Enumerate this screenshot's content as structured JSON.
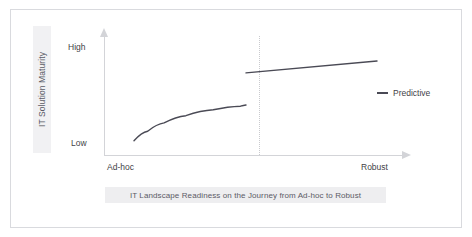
{
  "chart_data": {
    "type": "line",
    "title": "IT Landscape Readiness on the Journey from Ad-hoc to Robust",
    "xlabel": "",
    "ylabel": "IT Solution Maturity",
    "x_tick_labels": [
      "Ad-hoc",
      "Robust"
    ],
    "y_tick_labels": [
      "Low",
      "High"
    ],
    "ylim": [
      "Low",
      "High"
    ],
    "grid": false,
    "legend_position": "right",
    "legend": [
      "Predictive"
    ],
    "annotations": [
      "phase divider between Ad-hoc segment and Predictive segment"
    ],
    "series": [
      {
        "name": "Ad-hoc maturity curve",
        "shape": "concave-logarithmic",
        "points": [
          {
            "x": 0.11,
            "y": 0.12
          },
          {
            "x": 0.16,
            "y": 0.2
          },
          {
            "x": 0.22,
            "y": 0.27
          },
          {
            "x": 0.3,
            "y": 0.33
          },
          {
            "x": 0.4,
            "y": 0.38
          },
          {
            "x": 0.5,
            "y": 0.41
          },
          {
            "x": 0.52,
            "y": 0.42
          }
        ]
      },
      {
        "name": "Predictive",
        "shape": "linear-rising",
        "points": [
          {
            "x": 0.52,
            "y": 0.69
          },
          {
            "x": 1.0,
            "y": 0.79
          }
        ]
      }
    ],
    "colors": {
      "series_line": "#4a4a55",
      "axis": "#d3d4d8",
      "divider": "#c9cace",
      "band": "#eeeef0",
      "label_text": "#3f3f47",
      "frame": "#d9dade"
    }
  },
  "axis": {
    "y_title": "IT Solution Maturity",
    "tick_high": "High",
    "tick_low": "Low",
    "cat_left": "Ad-hoc",
    "cat_right": "Robust"
  },
  "legend": {
    "predictive_label": "Predictive"
  },
  "caption": {
    "text": "IT Landscape Readiness on the Journey from Ad-hoc to Robust"
  }
}
